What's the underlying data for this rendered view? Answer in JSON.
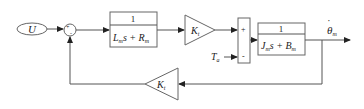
{
  "diagram": {
    "input": {
      "label": "U"
    },
    "summing_junction_1": {
      "signs": [
        "+",
        "-"
      ]
    },
    "tf_electrical": {
      "numerator": "1",
      "denominator": {
        "L": "L",
        "L_sub": "m",
        "s": "s + ",
        "R": "R",
        "R_sub": "m"
      }
    },
    "gain_forward": {
      "K": "K",
      "sub": "t"
    },
    "summing_junction_2": {
      "signs": [
        "+",
        "-"
      ]
    },
    "disturbance": {
      "T": "T",
      "sub": "a"
    },
    "tf_mechanical": {
      "numerator": "1",
      "denominator": {
        "J": "J",
        "J_sub": "m",
        "s": "s + ",
        "B": "B",
        "B_sub": "m"
      }
    },
    "output": {
      "symbol": "θ",
      "dot": "˙",
      "sub": "m"
    },
    "gain_feedback": {
      "K": "K",
      "sub": "t"
    }
  }
}
